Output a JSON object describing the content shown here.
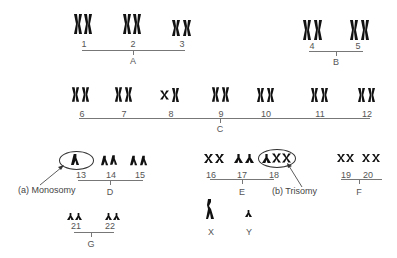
{
  "diagram": {
    "groups": [
      {
        "name": "A",
        "chromosomes": [
          "1",
          "2",
          "3"
        ]
      },
      {
        "name": "B",
        "chromosomes": [
          "4",
          "5"
        ]
      },
      {
        "name": "C",
        "chromosomes": [
          "6",
          "7",
          "8",
          "9",
          "10",
          "11",
          "12"
        ]
      },
      {
        "name": "D",
        "chromosomes": [
          "13",
          "14",
          "15"
        ]
      },
      {
        "name": "E",
        "chromosomes": [
          "16",
          "17",
          "18"
        ]
      },
      {
        "name": "F",
        "chromosomes": [
          "19",
          "20"
        ]
      },
      {
        "name": "G",
        "chromosomes": [
          "21",
          "22"
        ]
      }
    ],
    "sex_chromosomes": [
      "X",
      "Y"
    ],
    "annotations": {
      "monosomy": "(a)  Monosomy",
      "trisomy": "(b) Trisomy"
    },
    "colors": {
      "chromosome": "#111111",
      "line": "#777777",
      "text": "#555555"
    }
  }
}
